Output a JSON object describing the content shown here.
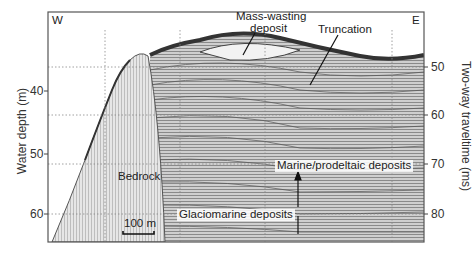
{
  "figure": {
    "type": "seismic-profile",
    "corner_labels": {
      "left": "W",
      "right": "E"
    },
    "left_axis": {
      "title": "Water depth (m)",
      "ticks": [
        "40",
        "50",
        "60"
      ]
    },
    "right_axis": {
      "title": "Two-way traveltime (ms)",
      "ticks": [
        "50",
        "60",
        "70",
        "80"
      ]
    },
    "scale_bar": {
      "label": "100 m"
    },
    "annotations": [
      {
        "id": "mass-wasting",
        "text_line1": "Mass-wasting",
        "text_line2": "deposit"
      },
      {
        "id": "truncation",
        "text": "Truncation"
      },
      {
        "id": "bedrock",
        "text": "Bedrock"
      },
      {
        "id": "marine",
        "text": "Marine/prodeltaic deposits"
      },
      {
        "id": "glaciomarine",
        "text": "Glaciomarine deposits"
      }
    ],
    "colors": {
      "frame": "#555555",
      "grid": "#888888",
      "ink": "#222222"
    }
  }
}
